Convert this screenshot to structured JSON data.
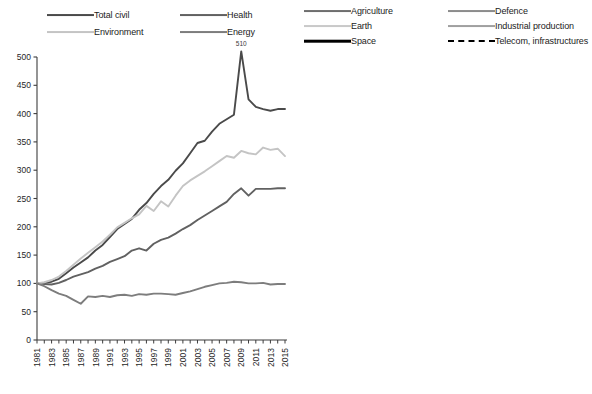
{
  "figure": {
    "title": "",
    "panels": [
      "left",
      "right"
    ]
  },
  "left_panel": {
    "legend": {
      "items": [
        {
          "label": "Total civil",
          "color": "#4a4a4a",
          "width": 1.9,
          "dash": "none",
          "col": 0,
          "row": 0
        },
        {
          "label": "Health",
          "color": "#616161",
          "width": 1.9,
          "dash": "none",
          "col": 1,
          "row": 0
        },
        {
          "label": "Environment",
          "color": "#c4c4c4",
          "width": 1.9,
          "dash": "none",
          "col": 0,
          "row": 1
        },
        {
          "label": "Energy",
          "color": "#7d7d7d",
          "width": 1.9,
          "dash": "none",
          "col": 1,
          "row": 1
        }
      ]
    },
    "annotations": [
      {
        "text": "510",
        "year": 2009,
        "value": 510
      }
    ]
  },
  "right_panel": {
    "legend": {
      "items": [
        {
          "label": "Agriculture",
          "color": "#6e6e6e",
          "width": 1.9,
          "dash": "none",
          "col": 0,
          "row": 0
        },
        {
          "label": "Defence",
          "color": "#8c8c8c",
          "width": 1.9,
          "dash": "none",
          "col": 1,
          "row": 0
        },
        {
          "label": "Earth",
          "color": "#c9c9c9",
          "width": 1.9,
          "dash": "none",
          "col": 0,
          "row": 1
        },
        {
          "label": "Industrial production",
          "color": "#a0a0a0",
          "width": 1.9,
          "dash": "none",
          "col": 1,
          "row": 1
        },
        {
          "label": "Space",
          "color": "#000000",
          "width": 2.6,
          "dash": "none",
          "col": 0,
          "row": 2
        },
        {
          "label": "Telecom, infrastructures",
          "color": "#000000",
          "width": 2.3,
          "dash": "dashed",
          "col": 1,
          "row": 2
        }
      ]
    }
  },
  "chart_data": [
    {
      "type": "line",
      "title": "",
      "xlabel": "",
      "ylabel": "",
      "xlim": [
        1981,
        2015
      ],
      "ylim": [
        0,
        500
      ],
      "yticks": [
        0,
        50,
        100,
        150,
        200,
        250,
        300,
        350,
        400,
        450,
        500
      ],
      "xticks": [
        1981,
        1982,
        1983,
        1984,
        1985,
        1986,
        1987,
        1988,
        1989,
        1990,
        1991,
        1992,
        1993,
        1994,
        1995,
        1996,
        1997,
        1998,
        1999,
        2000,
        2001,
        2002,
        2003,
        2004,
        2005,
        2006,
        2007,
        2008,
        2009,
        2010,
        2011,
        2012,
        2013,
        2014,
        2015
      ],
      "xtick_labels": [
        "1981",
        "",
        "1983",
        "",
        "1985",
        "",
        "1987",
        "",
        "1989",
        "",
        "1991",
        "",
        "1993",
        "",
        "1995",
        "",
        "1997",
        "",
        "1999",
        "",
        "2001",
        "",
        "2003",
        "",
        "2005",
        "",
        "2007",
        "",
        "2009",
        "",
        "2011",
        "",
        "2013",
        "",
        "2015"
      ],
      "grid": false,
      "legend_position": "top",
      "x": [
        1981,
        1982,
        1983,
        1984,
        1985,
        1986,
        1987,
        1988,
        1989,
        1990,
        1991,
        1992,
        1993,
        1994,
        1995,
        1996,
        1997,
        1998,
        1999,
        2000,
        2001,
        2002,
        2003,
        2004,
        2005,
        2006,
        2007,
        2008,
        2009,
        2010,
        2011,
        2012,
        2013,
        2014,
        2015
      ],
      "series": [
        {
          "name": "Total civil",
          "color": "#4a4a4a",
          "width": 1.9,
          "dash": "none",
          "values": [
            100,
            101,
            103,
            108,
            118,
            128,
            137,
            146,
            158,
            168,
            182,
            196,
            205,
            214,
            230,
            242,
            258,
            272,
            283,
            299,
            312,
            330,
            348,
            352,
            368,
            382,
            390,
            398,
            510,
            425,
            412,
            408,
            405,
            408,
            408
          ]
        },
        {
          "name": "Health",
          "color": "#616161",
          "width": 1.9,
          "dash": "none",
          "values": [
            100,
            99,
            98,
            101,
            106,
            112,
            116,
            120,
            126,
            131,
            138,
            143,
            148,
            158,
            162,
            158,
            170,
            177,
            181,
            188,
            196,
            203,
            212,
            220,
            228,
            236,
            244,
            258,
            268,
            255,
            267,
            267,
            267,
            268,
            268
          ]
        },
        {
          "name": "Environment",
          "color": "#c4c4c4",
          "width": 1.9,
          "dash": "none",
          "values": [
            100,
            102,
            106,
            112,
            122,
            133,
            144,
            154,
            164,
            174,
            186,
            199,
            207,
            215,
            222,
            237,
            228,
            245,
            236,
            255,
            272,
            282,
            290,
            298,
            307,
            316,
            325,
            322,
            334,
            330,
            328,
            340,
            336,
            338,
            325
          ]
        },
        {
          "name": "Energy",
          "color": "#7d7d7d",
          "width": 1.9,
          "dash": "none",
          "values": [
            100,
            95,
            88,
            82,
            78,
            71,
            64,
            77,
            76,
            78,
            76,
            79,
            80,
            78,
            81,
            80,
            82,
            82,
            81,
            80,
            83,
            86,
            90,
            94,
            97,
            100,
            101,
            103,
            102,
            100,
            100,
            101,
            98,
            99,
            99
          ]
        }
      ]
    },
    {
      "type": "line",
      "title": "",
      "xlabel": "",
      "ylabel": "",
      "xlim": [
        1981,
        2015
      ],
      "ylim": [
        0,
        500
      ],
      "yticks": [
        0,
        50,
        100,
        150,
        200,
        250,
        300,
        350,
        400,
        450,
        500
      ],
      "xticks": [
        1981,
        1982,
        1983,
        1984,
        1985,
        1986,
        1987,
        1988,
        1989,
        1990,
        1991,
        1992,
        1993,
        1994,
        1995,
        1996,
        1997,
        1998,
        1999,
        2000,
        2001,
        2002,
        2003,
        2004,
        2005,
        2006,
        2007,
        2008,
        2009,
        2010,
        2011,
        2012,
        2013,
        2014,
        2015
      ],
      "xtick_labels": [
        "1981",
        "",
        "1983",
        "",
        "1985",
        "",
        "1987",
        "",
        "1989",
        "",
        "1991",
        "",
        "1993",
        "",
        "1995",
        "",
        "1997",
        "",
        "1999",
        "",
        "2001",
        "",
        "2003",
        "",
        "2005",
        "",
        "2007",
        "",
        "2009",
        "",
        "2011",
        "",
        "2013",
        "",
        "2015"
      ],
      "grid": false,
      "legend_position": "top",
      "x": [
        1981,
        1982,
        1983,
        1984,
        1985,
        1986,
        1987,
        1988,
        1989,
        1990,
        1991,
        1992,
        1993,
        1994,
        1995,
        1996,
        1997,
        1998,
        1999,
        2000,
        2001,
        2002,
        2003,
        2004,
        2005,
        2006,
        2007,
        2008,
        2009,
        2010,
        2011,
        2012,
        2013,
        2014,
        2015
      ],
      "series": [
        {
          "name": "Agriculture",
          "color": "#6e6e6e",
          "width": 1.9,
          "dash": "none",
          "values": [
            100,
            103,
            110,
            118,
            125,
            133,
            140,
            148,
            152,
            158,
            165,
            172,
            168,
            176,
            180,
            176,
            170,
            168,
            162,
            158,
            156,
            152,
            150,
            152,
            156,
            160,
            162,
            158,
            160,
            158,
            156,
            160,
            158,
            160,
            160
          ]
        },
        {
          "name": "Defence",
          "color": "#8c8c8c",
          "width": 1.9,
          "dash": "none",
          "values": [
            100,
            98,
            96,
            94,
            97,
            100,
            105,
            108,
            112,
            116,
            120,
            124,
            128,
            130,
            132,
            134,
            136,
            138,
            140,
            142,
            146,
            152,
            160,
            172,
            186,
            196,
            212,
            232,
            252,
            248,
            262,
            268,
            272,
            270,
            276
          ]
        },
        {
          "name": "Earth",
          "color": "#c9c9c9",
          "width": 1.9,
          "dash": "none",
          "values": [
            100,
            96,
            92,
            88,
            86,
            88,
            92,
            98,
            104,
            110,
            116,
            122,
            128,
            134,
            140,
            146,
            148,
            150,
            152,
            150,
            148,
            146,
            150,
            154,
            160,
            166,
            172,
            176,
            182,
            186,
            190,
            194,
            196,
            198,
            200
          ]
        },
        {
          "name": "Industrial production",
          "color": "#a0a0a0",
          "width": 1.9,
          "dash": "none",
          "values": [
            100,
            97,
            94,
            90,
            87,
            90,
            95,
            100,
            106,
            112,
            118,
            124,
            130,
            136,
            140,
            144,
            146,
            144,
            142,
            140,
            143,
            146,
            150,
            152,
            155,
            158,
            160,
            162,
            164,
            162,
            158,
            156,
            154,
            156,
            152
          ]
        },
        {
          "name": "Space",
          "color": "#000000",
          "width": 2.6,
          "dash": "none",
          "values": [
            100,
            92,
            84,
            78,
            76,
            78,
            86,
            100,
            118,
            138,
            158,
            172,
            184,
            192,
            198,
            200,
            199,
            200,
            202,
            206,
            208,
            212,
            210,
            208,
            200,
            188,
            185,
            192,
            198,
            196,
            206,
            208,
            206,
            210,
            208
          ]
        },
        {
          "name": "Telecom, infrastructures",
          "color": "#000000",
          "width": 2.3,
          "dash": "dashed",
          "values": [
            100,
            92,
            84,
            80,
            78,
            80,
            84,
            88,
            92,
            96,
            100,
            104,
            106,
            108,
            110,
            112,
            114,
            116,
            118,
            120,
            126,
            132,
            138,
            142,
            140,
            138,
            142,
            146,
            150,
            152,
            150,
            148,
            146,
            148,
            146
          ]
        }
      ]
    }
  ]
}
